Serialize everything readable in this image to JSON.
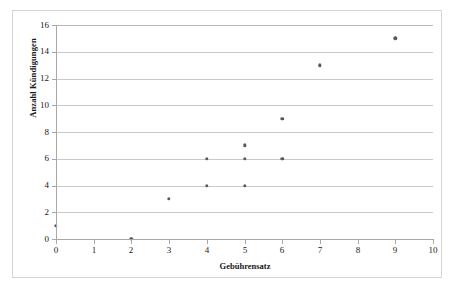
{
  "chart_data": {
    "type": "scatter",
    "title": "",
    "xlabel": "Gebührensatz",
    "ylabel": "Anzahl Kündigungen",
    "xlim": [
      0,
      10
    ],
    "ylim": [
      0,
      16
    ],
    "xticks": [
      "0",
      "1",
      "2",
      "3",
      "4",
      "5",
      "6",
      "7",
      "8",
      "9",
      "10"
    ],
    "yticks": [
      "0",
      "2",
      "4",
      "6",
      "8",
      "10",
      "12",
      "14",
      "16"
    ],
    "grid": "horizontal",
    "legend": "none",
    "marker_color": "#595959",
    "gridline_color": "#c9c9c9",
    "axis_color": "#a8a8a8",
    "border_color": "#d4d4d4",
    "points": [
      {
        "x": 0,
        "y": 1
      },
      {
        "x": 2,
        "y": 0
      },
      {
        "x": 3,
        "y": 3
      },
      {
        "x": 4,
        "y": 4
      },
      {
        "x": 4,
        "y": 6
      },
      {
        "x": 5,
        "y": 4
      },
      {
        "x": 5,
        "y": 6
      },
      {
        "x": 5,
        "y": 7
      },
      {
        "x": 6,
        "y": 6
      },
      {
        "x": 6,
        "y": 9
      },
      {
        "x": 7,
        "y": 13
      },
      {
        "x": 9,
        "y": 15
      }
    ]
  }
}
